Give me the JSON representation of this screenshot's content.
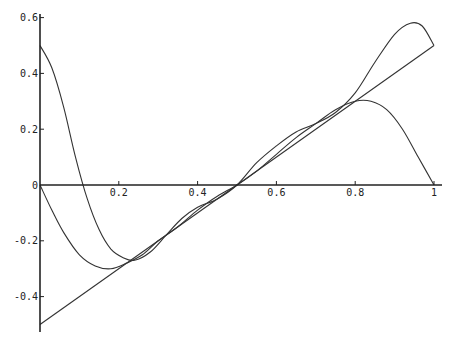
{
  "chart_data": {
    "type": "line",
    "title": "",
    "xlabel": "",
    "ylabel": "",
    "xlim": [
      0,
      1
    ],
    "ylim": [
      -0.5,
      0.6
    ],
    "grid": false,
    "legend": null,
    "x_ticks": [
      {
        "value": 0.2,
        "label": "0.2"
      },
      {
        "value": 0.4,
        "label": "0.4"
      },
      {
        "value": 0.6,
        "label": "0.6"
      },
      {
        "value": 0.8,
        "label": "0.8"
      },
      {
        "value": 1,
        "label": "1"
      }
    ],
    "y_ticks": [
      {
        "value": 0.6,
        "label": "0.6"
      },
      {
        "value": 0.4,
        "label": "0.4"
      },
      {
        "value": 0.2,
        "label": "0.2"
      },
      {
        "value": 0,
        "label": "0"
      },
      {
        "value": -0.2,
        "label": "-0.2"
      },
      {
        "value": -0.4,
        "label": "-0.4"
      }
    ],
    "series": [
      {
        "name": "line",
        "x": [
          0,
          1
        ],
        "y": [
          -0.5,
          0.5
        ]
      },
      {
        "name": "curve-a",
        "x": [
          0,
          0.03,
          0.06,
          0.1,
          0.14,
          0.18,
          0.22,
          0.26,
          0.3,
          0.35,
          0.4,
          0.45,
          0.5,
          0.55,
          0.6,
          0.65,
          0.7,
          0.75,
          0.8,
          0.84,
          0.88,
          0.92,
          0.96,
          1.0
        ],
        "y": [
          0,
          -0.09,
          -0.17,
          -0.25,
          -0.29,
          -0.3,
          -0.28,
          -0.25,
          -0.2,
          -0.15,
          -0.09,
          -0.04,
          0.0,
          0.05,
          0.11,
          0.17,
          0.22,
          0.27,
          0.3,
          0.3,
          0.27,
          0.2,
          0.1,
          0.0
        ]
      },
      {
        "name": "curve-b",
        "x": [
          0,
          0.03,
          0.06,
          0.09,
          0.12,
          0.15,
          0.18,
          0.21,
          0.24,
          0.28,
          0.32,
          0.36,
          0.4,
          0.45,
          0.5,
          0.55,
          0.6,
          0.65,
          0.7,
          0.75,
          0.8,
          0.85,
          0.9,
          0.94,
          0.97,
          1.0
        ],
        "y": [
          0.5,
          0.42,
          0.28,
          0.1,
          -0.05,
          -0.16,
          -0.23,
          -0.26,
          -0.27,
          -0.24,
          -0.18,
          -0.12,
          -0.08,
          -0.05,
          0.0,
          0.08,
          0.14,
          0.19,
          0.22,
          0.26,
          0.33,
          0.44,
          0.54,
          0.58,
          0.57,
          0.5
        ]
      }
    ]
  }
}
